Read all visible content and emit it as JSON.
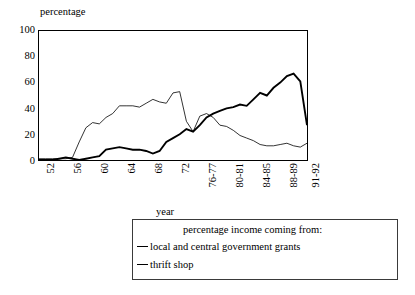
{
  "axes": {
    "y_title": "percentage",
    "x_title": "year",
    "y_ticks": [
      "100",
      "80",
      "60",
      "40",
      "20",
      "0"
    ],
    "x_ticks": [
      "52",
      "56",
      "60",
      "64",
      "68",
      "72",
      "76-77",
      "80-81",
      "84-85",
      "88-89",
      "91-92"
    ]
  },
  "legend": {
    "title": "percentage income coming from:",
    "entries": [
      {
        "label": "local and central government grants",
        "style": "thick"
      },
      {
        "label": "thrift shop",
        "style": "thin"
      }
    ]
  },
  "chart_data": {
    "type": "line",
    "title": "",
    "xlabel": "year",
    "ylabel": "percentage",
    "ylim": [
      0,
      100
    ],
    "xlim": [
      1952,
      1992
    ],
    "grid": false,
    "legend_position": "below-plot",
    "x": [
      1952,
      1953,
      1954,
      1955,
      1956,
      1957,
      1958,
      1959,
      1960,
      1961,
      1962,
      1963,
      1964,
      1965,
      1966,
      1967,
      1968,
      1969,
      1970,
      1971,
      1972,
      1973,
      1974,
      1975,
      1976,
      1977,
      1978,
      1979,
      1980,
      1981,
      1982,
      1983,
      1984,
      1985,
      1986,
      1987,
      1988,
      1989,
      1990,
      1991,
      1992
    ],
    "x_tick_labels": [
      "52",
      "56",
      "60",
      "64",
      "68",
      "72",
      "76-77",
      "80-81",
      "84-85",
      "88-89",
      "91-92"
    ],
    "series": [
      {
        "name": "local and central government grants",
        "style": "thick",
        "color": "#000000",
        "values": [
          0,
          0,
          0,
          1,
          2,
          1,
          0,
          1,
          2,
          3,
          8,
          9,
          10,
          9,
          8,
          8,
          7,
          5,
          7,
          14,
          17,
          20,
          24,
          22,
          27,
          33,
          36,
          38,
          40,
          41,
          43,
          42,
          47,
          52,
          50,
          56,
          60,
          65,
          67,
          61,
          27
        ]
      },
      {
        "name": "thrift shop",
        "style": "thin",
        "color": "#000000",
        "values": [
          1,
          1,
          1,
          1,
          1,
          2,
          14,
          25,
          29,
          28,
          33,
          36,
          42,
          42,
          42,
          41,
          44,
          47,
          45,
          44,
          52,
          53,
          30,
          22,
          34,
          36,
          33,
          27,
          26,
          23,
          19,
          17,
          15,
          12,
          11,
          11,
          12,
          13,
          11,
          10,
          13
        ]
      }
    ]
  }
}
